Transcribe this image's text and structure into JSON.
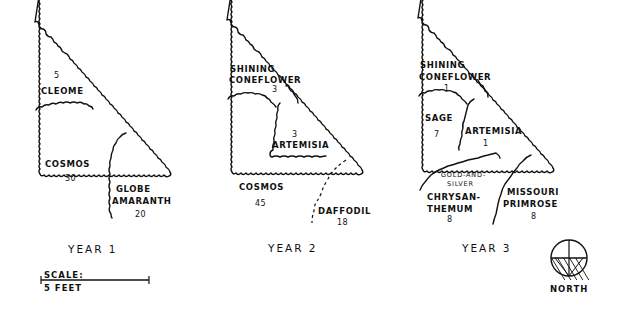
{
  "diagram": {
    "type": "garden-bed-succession-plan",
    "plans": [
      {
        "title": "YEAR 1",
        "regions": [
          {
            "name": "CLEOME",
            "count": "5"
          },
          {
            "name": "COSMOS",
            "count": "30"
          },
          {
            "name_line1": "GLOBE",
            "name_line2": "AMARANTH",
            "count": "20"
          }
        ]
      },
      {
        "title": "YEAR 2",
        "regions": [
          {
            "name_line1": "SHINING",
            "name_line2": "CONEFLOWER",
            "count": "3"
          },
          {
            "name": "ARTEMISIA",
            "count": "3"
          },
          {
            "name": "COSMOS",
            "count": "45"
          },
          {
            "name": "DAFFODIL",
            "count": "18"
          }
        ]
      },
      {
        "title": "YEAR 3",
        "regions": [
          {
            "name_line1": "SHINING",
            "name_line2": "CONEFLOWER",
            "count": "1"
          },
          {
            "name": "SAGE",
            "count": "7"
          },
          {
            "name": "ARTEMISIA",
            "count": "1"
          },
          {
            "name_line1": "GOLD-AND-",
            "name_line2": "SILVER",
            "name_line3": "CHRYSAN-",
            "name_line4": "THEMUM",
            "count": "8"
          },
          {
            "name_line1": "MISSOURI",
            "name_line2": "PRIMROSE",
            "count": "8"
          }
        ]
      }
    ],
    "scale": {
      "label": "SCALE:",
      "value": "5 FEET"
    },
    "compass": {
      "label": "NORTH"
    }
  }
}
